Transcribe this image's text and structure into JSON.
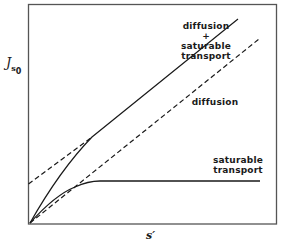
{
  "diagram": {
    "y_axis_label": "J",
    "y_axis_subscript": "s",
    "y_axis_subsubscript": "0",
    "x_axis_label": "s′",
    "curves": [
      {
        "name": "diffusion-plus-saturable",
        "style": "solid",
        "label_lines": [
          "diffusion",
          "+",
          "saturable",
          "transport"
        ]
      },
      {
        "name": "diffusion",
        "style": "dashed",
        "label_lines": [
          "diffusion"
        ]
      },
      {
        "name": "saturable-transport",
        "style": "solid",
        "label_lines": [
          "saturable",
          "transport"
        ]
      },
      {
        "name": "asymptote",
        "style": "dashed",
        "label_lines": []
      }
    ],
    "colors": {
      "ink": "#1a1a1a",
      "frame": "#555555",
      "background": "#ffffff"
    }
  }
}
